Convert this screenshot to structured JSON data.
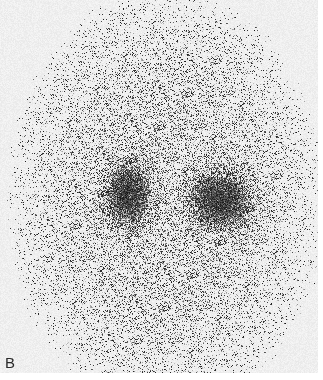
{
  "figure": {
    "panel_label": "B",
    "background_color": "#f0f0f0",
    "ink_color": "#111111",
    "width": 318,
    "height": 373
  },
  "field": {
    "center_x": 165,
    "center_y": 200,
    "radius_x": 150,
    "radius_y": 200,
    "base_density": 0.18
  },
  "hotspots": [
    {
      "name": "left-uptake",
      "cx": 128,
      "cy": 195,
      "rx": 24,
      "ry": 34,
      "intensity": 0.85
    },
    {
      "name": "right-uptake",
      "cx": 220,
      "cy": 200,
      "rx": 32,
      "ry": 30,
      "intensity": 0.9
    }
  ]
}
